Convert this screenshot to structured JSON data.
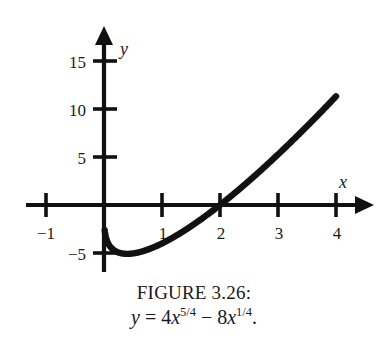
{
  "figure": {
    "caption_title": "FIGURE 3.26:",
    "equation": {
      "lhs": "y",
      "equals": "=",
      "term1_coeff": "4",
      "term1_var": "x",
      "term1_exp": "5/4",
      "operator": "−",
      "term2_coeff": "8",
      "term2_var": "x",
      "term2_exp": "1/4",
      "period": "."
    }
  },
  "axes": {
    "x_label": "x",
    "y_label": "y",
    "x_ticks": [
      {
        "label": "−1",
        "value": -1
      },
      {
        "label": "1",
        "value": 1
      },
      {
        "label": "2",
        "value": 2
      },
      {
        "label": "3",
        "value": 3
      },
      {
        "label": "4",
        "value": 4
      }
    ],
    "y_ticks": [
      {
        "label": "15",
        "value": 15
      },
      {
        "label": "10",
        "value": 10
      },
      {
        "label": "5",
        "value": 5
      },
      {
        "label": "−5",
        "value": -5
      }
    ]
  },
  "colors": {
    "ink": "#111111",
    "background": "#ffffff"
  },
  "chart_data": {
    "type": "line",
    "title": "FIGURE 3.26:",
    "subtitle": "y = 4x^(5/4) - 8x^(1/4).",
    "xlabel": "x",
    "ylabel": "y",
    "xlim": [
      -1.35,
      4.55
    ],
    "ylim": [
      -6.4,
      16.6
    ],
    "grid": false,
    "legend": "none",
    "xticks": [
      -1,
      1,
      2,
      3,
      4
    ],
    "yticks": [
      -5,
      5,
      10,
      15
    ],
    "series": [
      {
        "name": "y = 4x^(5/4) - 8x^(1/4)",
        "x": [
          0.03,
          0.1,
          0.2,
          0.3,
          0.45,
          0.6,
          0.8,
          1.0,
          1.25,
          1.5,
          1.75,
          2.0,
          2.25,
          2.5,
          2.75,
          3.0,
          3.25,
          3.5,
          3.75,
          4.0
        ],
        "y": [
          -3.68,
          -4.44,
          -4.99,
          -5.2,
          -5.25,
          -5.15,
          -4.85,
          -4.0,
          -3.16,
          -2.11,
          -0.89,
          0.48,
          1.98,
          3.6,
          5.33,
          7.17,
          9.1,
          11.12,
          13.23,
          11.3
        ]
      }
    ],
    "x_intercept": 2,
    "minimum_approx": {
      "x": 0.45,
      "y": -5.25
    },
    "endpoint": {
      "x": 4,
      "y": 11.3
    }
  }
}
